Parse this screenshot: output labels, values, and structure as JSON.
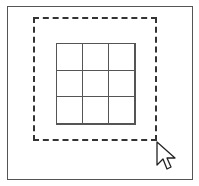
{
  "diagram": {
    "grid": {
      "rows": 3,
      "cols": 3
    },
    "colors": {
      "stroke": "#555555",
      "marquee": "#333333",
      "background": "#ffffff"
    },
    "cursor_icon": "arrow-pointer-icon"
  }
}
